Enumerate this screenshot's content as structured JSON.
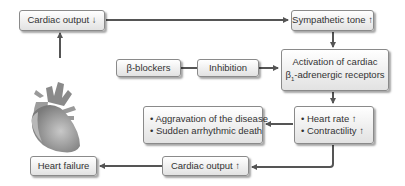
{
  "diagram": {
    "colors": {
      "box_border": "#8a8a8a",
      "box_fill_top": "#ffffff",
      "box_fill_bottom": "#e2e2e2",
      "arrow": "#555555",
      "text": "#333333"
    },
    "nodes": {
      "cardiac_output_down": {
        "label": "Cardiac output ↓"
      },
      "sympathetic_tone_up": {
        "label": "Sympathetic tone ↑"
      },
      "activation": {
        "line1": "Activation of cardiac",
        "line2_prefix": "β",
        "line2_sub": "1",
        "line2_suffix": "-adrenergic receptors"
      },
      "beta_blockers": {
        "label": "β-blockers"
      },
      "inhibition": {
        "label": "Inhibition"
      },
      "consequences": {
        "items": [
          "• Aggravation of the disease",
          "• Sudden arrhythmic death"
        ]
      },
      "heart_effects": {
        "items": [
          "• Heart rate ↑",
          "• Contractility ↑"
        ]
      },
      "cardiac_output_up": {
        "label": "Cardiac output ↑"
      },
      "heart_failure": {
        "label": "Heart failure"
      }
    },
    "edges": [
      {
        "from": "heart-illustration",
        "to": "cardiac_output_down"
      },
      {
        "from": "cardiac_output_down",
        "to": "sympathetic_tone_up"
      },
      {
        "from": "sympathetic_tone_up",
        "to": "activation"
      },
      {
        "from": "beta_blockers",
        "to": "inhibition"
      },
      {
        "from": "inhibition",
        "to": "activation"
      },
      {
        "from": "activation",
        "to": "heart_effects"
      },
      {
        "from": "heart_effects",
        "to": "consequences"
      },
      {
        "from": "heart_effects",
        "to": "cardiac_output_up"
      },
      {
        "from": "cardiac_output_up",
        "to": "heart_failure"
      }
    ],
    "illustration": "heart-icon"
  }
}
